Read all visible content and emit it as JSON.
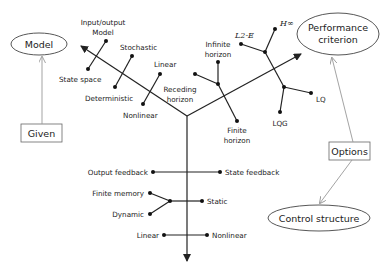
{
  "nodes": {
    "model": "Model",
    "performance_line1": "Performance",
    "performance_line2": "criterion",
    "control_structure": "Control structure",
    "given": "Given",
    "options": "Options"
  },
  "model_branch": {
    "io_line1": "Input/output",
    "io_line2": "Model",
    "state_space": "State space",
    "stochastic": "Stochastic",
    "deterministic": "Deterministic",
    "linear": "Linear",
    "nonlinear": "Nonlinear"
  },
  "performance_branch": {
    "infinite_line1": "Infinite",
    "infinite_line2": "horizon",
    "receding_line1": "Receding",
    "receding_line2": "horizon",
    "finite_line1": "Finite",
    "finite_line2": "horizon",
    "l2e": "L2-E",
    "hinf": "H∞",
    "lq": "LQ",
    "lqg": "LQG"
  },
  "control_branch": {
    "output_feedback": "Output feedback",
    "state_feedback": "State feedback",
    "finite_memory": "Finite memory",
    "dynamic": "Dynamic",
    "static": "Static",
    "linear": "Linear",
    "nonlinear": "Nonlinear"
  },
  "colors": {
    "line": "#222222",
    "connector": "#999999",
    "background": "#ffffff"
  }
}
